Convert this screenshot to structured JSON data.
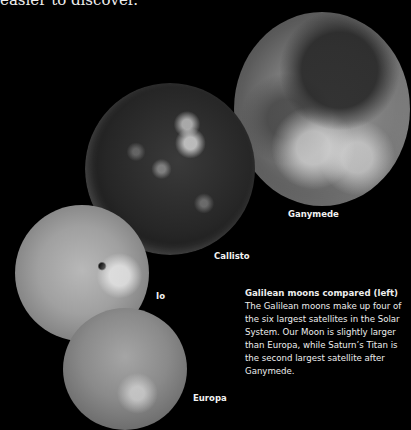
{
  "top_text": "easier to discover.",
  "moons": {
    "ganymede": "Ganymede",
    "callisto": "Callisto",
    "io": "Io",
    "europa": "Europa"
  },
  "caption": {
    "heading": "Galilean moons compared (left)",
    "body": "The Galilean moons make up four of the six largest satellites in the Solar System. Our Moon is slightly larger than Europa, while Saturn’s Titan is the second largest satellite after Ganymede."
  }
}
